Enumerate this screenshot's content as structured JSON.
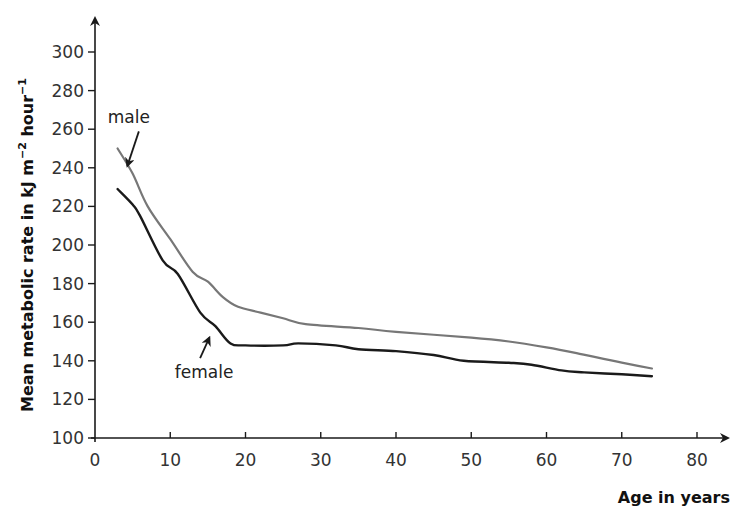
{
  "chart_data": {
    "type": "line",
    "title": "",
    "xlabel": "Age in years",
    "ylabel": "Mean metabolic rate  in kJ m⁻² hour⁻¹",
    "ylabel_parts": {
      "main": "Mean metabolic rate  in kJ m",
      "sup1": "−2",
      "mid": " hour",
      "sup2": "−1"
    },
    "xlim": [
      0,
      80
    ],
    "ylim": [
      100,
      300
    ],
    "x_ticks": [
      0,
      10,
      20,
      30,
      40,
      50,
      60,
      70,
      80
    ],
    "y_ticks": [
      100,
      120,
      140,
      160,
      180,
      200,
      220,
      240,
      260,
      280,
      300
    ],
    "grid": false,
    "legend": "none (inline annotations)",
    "series": [
      {
        "name": "male",
        "color": "#777777",
        "x": [
          3,
          5,
          7,
          10,
          13,
          15,
          17,
          19,
          22,
          25,
          28,
          35,
          40,
          50,
          55,
          60,
          64,
          70,
          74
        ],
        "values": [
          250,
          237,
          220,
          203,
          186,
          181,
          173,
          168,
          165,
          162,
          159,
          157,
          155,
          152,
          150,
          147,
          144,
          139,
          136
        ]
      },
      {
        "name": "female",
        "color": "#1a1a1a",
        "x": [
          3,
          5,
          6,
          9,
          11,
          14,
          16,
          18,
          20,
          25,
          27,
          32,
          35,
          40,
          45,
          49,
          55,
          58,
          62,
          65,
          70,
          74
        ],
        "values": [
          229,
          221,
          215,
          192,
          185,
          165,
          158,
          149,
          148,
          148,
          149,
          148,
          146,
          145,
          143,
          140,
          139,
          138,
          135,
          134,
          133,
          132
        ]
      }
    ],
    "annotations": [
      {
        "text": "male",
        "label_x": 4.5,
        "label_y": 263,
        "arrow_to": [
          4.3,
          241
        ]
      },
      {
        "text": "female",
        "label_x": 14.5,
        "label_y": 131,
        "arrow_to": [
          15.2,
          152
        ]
      }
    ]
  }
}
